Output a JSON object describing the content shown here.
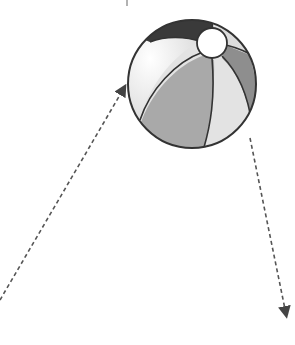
{
  "diagram": {
    "colors": {
      "outline": "#333333",
      "panel_dark": "#3a3a3a",
      "panel_white": "#f4f4f4",
      "panel_light": "#dcdcdc",
      "panel_mid": "#a9a9a9",
      "panel_mid_dark": "#8e8e8e",
      "panel_lightest": "#e3e3e3",
      "cap": "#ffffff",
      "arrow": "#555555"
    },
    "arrows": [
      {
        "name": "incoming-trajectory",
        "direction": "toward-ball"
      },
      {
        "name": "outgoing-trajectory",
        "direction": "away-from-ball"
      }
    ]
  }
}
